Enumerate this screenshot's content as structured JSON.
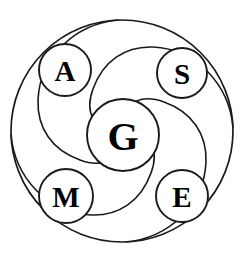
{
  "diagram": {
    "type": "circular-node-diagram",
    "background_color": "#ffffff",
    "stroke_color": "#1a1a1a",
    "label_color": "#000000",
    "outer_ring": {
      "name": "outer-boundary-circle",
      "cx": 122,
      "cy": 131,
      "r": 111
    },
    "center_node": {
      "id": "G",
      "label": "G",
      "cx": 123,
      "cy": 135,
      "r": 36
    },
    "nodes": [
      {
        "id": "A",
        "label": "A",
        "cx": 65,
        "cy": 70,
        "r": 26,
        "position": "top-left"
      },
      {
        "id": "S",
        "label": "S",
        "cx": 182,
        "cy": 73,
        "r": 25,
        "position": "top-right"
      },
      {
        "id": "M",
        "label": "M",
        "cx": 66,
        "cy": 196,
        "r": 27,
        "position": "bottom-left"
      },
      {
        "id": "E",
        "label": "E",
        "cx": 182,
        "cy": 196,
        "r": 26,
        "position": "bottom-right"
      }
    ],
    "swirl_arcs": [
      {
        "id": "arc-1",
        "from": "A",
        "to": "S",
        "sweep": "clockwise"
      },
      {
        "id": "arc-2",
        "from": "S",
        "to": "E",
        "sweep": "clockwise"
      },
      {
        "id": "arc-3",
        "from": "E",
        "to": "M",
        "sweep": "clockwise"
      },
      {
        "id": "arc-4",
        "from": "M",
        "to": "A",
        "sweep": "clockwise"
      }
    ]
  }
}
